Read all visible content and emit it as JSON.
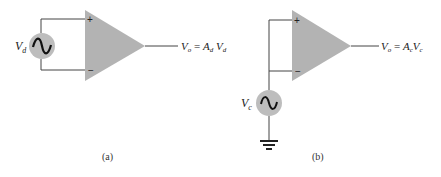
{
  "diagrams": [
    {
      "id": "a",
      "caption": "(a)",
      "source_label": "V",
      "source_label_sub": "d",
      "plus_sign": "+",
      "minus_sign": "−",
      "output": {
        "v": "V",
        "v_sub": "o",
        "eq": " = ",
        "a": "A",
        "a_sub": "d",
        "x": "V",
        "x_sub": "d"
      }
    },
    {
      "id": "b",
      "caption": "(b)",
      "source_label": "V",
      "source_label_sub": "c",
      "plus_sign": "+",
      "minus_sign": "−",
      "output": {
        "v": "V",
        "v_sub": "o",
        "eq": " = ",
        "a": "A",
        "a_sub": "c",
        "x": "V",
        "x_sub": "c"
      }
    }
  ],
  "colors": {
    "amp_fill": "#b3b3b3",
    "source_fill": "#bdbdbd",
    "wire": "#444444"
  }
}
